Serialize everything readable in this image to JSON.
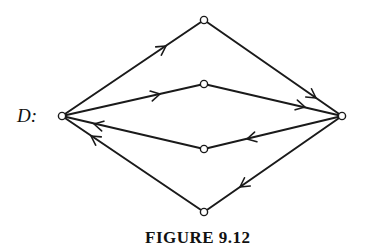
{
  "graph": {
    "label": "D:",
    "caption": "FIGURE 9.12",
    "nodes": [
      {
        "id": "left",
        "x": 62,
        "y": 116
      },
      {
        "id": "top",
        "x": 204,
        "y": 20
      },
      {
        "id": "upper-mid",
        "x": 204,
        "y": 84
      },
      {
        "id": "lower-mid",
        "x": 204,
        "y": 149
      },
      {
        "id": "bottom",
        "x": 204,
        "y": 212
      },
      {
        "id": "right",
        "x": 342,
        "y": 116
      }
    ],
    "edges": [
      {
        "from": "left",
        "to": "top",
        "directed": true
      },
      {
        "from": "top",
        "to": "right",
        "directed": true
      },
      {
        "from": "left",
        "to": "upper-mid",
        "directed": true
      },
      {
        "from": "upper-mid",
        "to": "right",
        "directed": true
      },
      {
        "from": "right",
        "to": "lower-mid",
        "directed": true
      },
      {
        "from": "lower-mid",
        "to": "left",
        "directed": true
      },
      {
        "from": "right",
        "to": "bottom",
        "directed": true
      },
      {
        "from": "bottom",
        "to": "left",
        "directed": true
      }
    ]
  }
}
